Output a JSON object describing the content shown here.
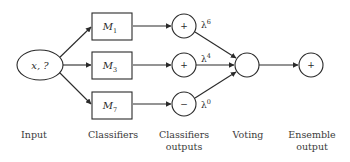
{
  "diagram": {
    "type": "ensemble-classifier-flow",
    "input": {
      "label": "x, ?"
    },
    "classifiers": [
      {
        "name": "M",
        "subscript": "1"
      },
      {
        "name": "M",
        "subscript": "3"
      },
      {
        "name": "M",
        "subscript": "7"
      }
    ],
    "classifier_outputs": [
      {
        "sign": "+",
        "weight_base": "λ",
        "weight_exp": "6"
      },
      {
        "sign": "+",
        "weight_base": "λ",
        "weight_exp": "4"
      },
      {
        "sign": "−",
        "weight_base": "λ",
        "weight_exp": "0"
      }
    ],
    "voting": {
      "label": ""
    },
    "ensemble_output": {
      "sign": "+"
    },
    "stage_labels": {
      "input": [
        "Input"
      ],
      "classifiers": [
        "Classifiers"
      ],
      "classifiers_outputs": [
        "Classifiers",
        "outputs"
      ],
      "voting": [
        "Voting"
      ],
      "ensemble_output": [
        "Ensemble",
        "output"
      ]
    },
    "colors": {
      "stroke": "#2a2a2a",
      "text": "#3a3a3a",
      "background": "#ffffff"
    }
  }
}
